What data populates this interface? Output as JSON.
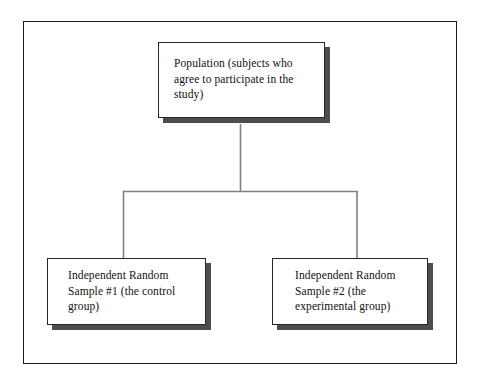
{
  "diagram": {
    "frame": {
      "border_color": "#1c1c1c"
    },
    "style": {
      "box_fill": "#ffffff",
      "box_border": "#262626",
      "box_shadow": "#4d4d4d",
      "connector_color": "#808080",
      "text_color": "#111111"
    },
    "nodes": [
      {
        "id": "population",
        "label": "Population (subjects who agree to participate in the study)"
      },
      {
        "id": "sample-1",
        "label": "Independent Random Sample #1 (the control group)"
      },
      {
        "id": "sample-2",
        "label": "Independent Random Sample #2 (the experimental group)"
      }
    ],
    "connectors": [
      {
        "id": "stem-from-population",
        "from": "population",
        "to": "split-bar"
      },
      {
        "id": "split-bar",
        "from": "split-bar",
        "to": "sample-1"
      },
      {
        "id": "branch-to-sample-2",
        "from": "split-bar",
        "to": "sample-2"
      }
    ]
  }
}
